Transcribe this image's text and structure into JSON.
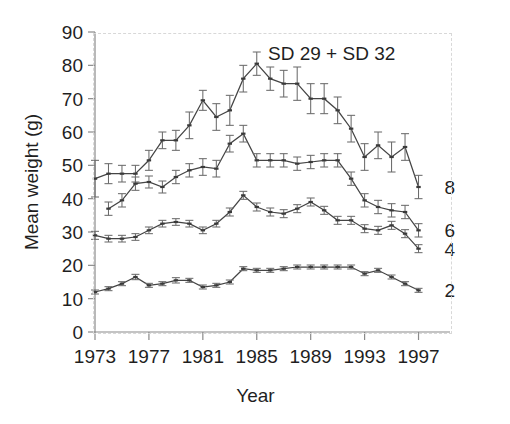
{
  "chart_data": {
    "type": "line",
    "title": "SD 29 + SD 32",
    "xlabel": "Year",
    "ylabel": "Mean weight (g)",
    "xlim": [
      1973,
      1998
    ],
    "ylim": [
      0,
      90
    ],
    "ytick_step": 10,
    "yticks": [
      0,
      10,
      20,
      30,
      40,
      50,
      60,
      70,
      80,
      90
    ],
    "xticks": [
      1973,
      1977,
      1981,
      1985,
      1989,
      1993,
      1997
    ],
    "xtick_labels": [
      "1973",
      "1977",
      "1981",
      "1985",
      "1989",
      "1993",
      "1997"
    ],
    "grid": false,
    "legend_position": "right-inline",
    "error_bars": "vertical, symmetric",
    "x": [
      1973,
      1974,
      1975,
      1976,
      1977,
      1978,
      1979,
      1980,
      1981,
      1982,
      1983,
      1984,
      1985,
      1986,
      1987,
      1988,
      1989,
      1990,
      1991,
      1992,
      1993,
      1994,
      1995,
      1996,
      1997
    ],
    "series": [
      {
        "name": "8",
        "label": "8",
        "values": [
          46.0,
          47.5,
          47.5,
          47.5,
          51.5,
          57.5,
          57.5,
          62.0,
          69.5,
          64.5,
          66.5,
          76.0,
          80.5,
          76.0,
          74.5,
          74.5,
          70.0,
          70.0,
          66.5,
          61.0,
          52.5,
          56.0,
          52.5,
          55.5,
          43.5
        ],
        "errors": [
          5.5,
          3.0,
          2.5,
          2.5,
          3.0,
          2.5,
          3.0,
          4.0,
          3.0,
          4.0,
          4.5,
          4.0,
          3.5,
          3.5,
          4.0,
          5.0,
          4.5,
          4.5,
          4.0,
          4.0,
          4.0,
          4.0,
          4.5,
          4.0,
          3.5
        ]
      },
      {
        "name": "6",
        "label": "6",
        "values": [
          null,
          37.0,
          39.5,
          44.5,
          45.0,
          43.5,
          46.5,
          48.5,
          49.5,
          49.0,
          56.5,
          59.5,
          51.5,
          51.5,
          51.5,
          50.5,
          51.0,
          51.5,
          51.5,
          46.0,
          39.5,
          37.5,
          36.5,
          36.0,
          30.5
        ],
        "errors": [
          null,
          2.0,
          2.0,
          2.0,
          1.8,
          1.8,
          2.0,
          2.0,
          2.5,
          2.5,
          2.5,
          2.5,
          2.0,
          2.0,
          2.0,
          2.0,
          2.0,
          2.0,
          2.0,
          2.0,
          2.0,
          2.0,
          2.0,
          2.0,
          2.0
        ]
      },
      {
        "name": "4",
        "label": "4",
        "values": [
          29.0,
          28.0,
          28.0,
          28.5,
          30.5,
          32.5,
          33.0,
          32.5,
          30.5,
          32.5,
          36.0,
          41.0,
          37.5,
          36.0,
          35.5,
          37.0,
          39.0,
          36.5,
          33.5,
          33.5,
          31.0,
          30.5,
          32.0,
          29.5,
          25.0
        ],
        "errors": [
          1.2,
          1.0,
          1.0,
          1.0,
          1.0,
          1.0,
          1.0,
          1.0,
          1.0,
          1.0,
          1.2,
          1.2,
          1.2,
          1.2,
          1.2,
          1.2,
          1.2,
          1.2,
          1.2,
          1.2,
          1.2,
          1.2,
          1.2,
          1.2,
          1.2
        ]
      },
      {
        "name": "2",
        "label": "2",
        "values": [
          12.0,
          13.0,
          14.5,
          16.5,
          14.0,
          14.5,
          15.5,
          15.5,
          13.5,
          14.0,
          15.0,
          19.0,
          18.5,
          18.5,
          19.0,
          19.5,
          19.5,
          19.5,
          19.5,
          19.5,
          17.5,
          18.5,
          16.5,
          14.5,
          12.5
        ],
        "errors": [
          0.6,
          0.6,
          0.6,
          0.8,
          0.6,
          0.6,
          0.8,
          0.6,
          0.6,
          0.6,
          0.6,
          0.6,
          0.6,
          0.6,
          0.6,
          0.6,
          0.6,
          0.6,
          0.6,
          0.6,
          0.6,
          0.6,
          0.6,
          0.6,
          0.6
        ]
      }
    ]
  },
  "colors": {
    "line": "#454545",
    "errorbar": "#6b6b6b",
    "axis": "#8a8a8a",
    "text": "#1f1f1f",
    "background": "#ffffff"
  }
}
